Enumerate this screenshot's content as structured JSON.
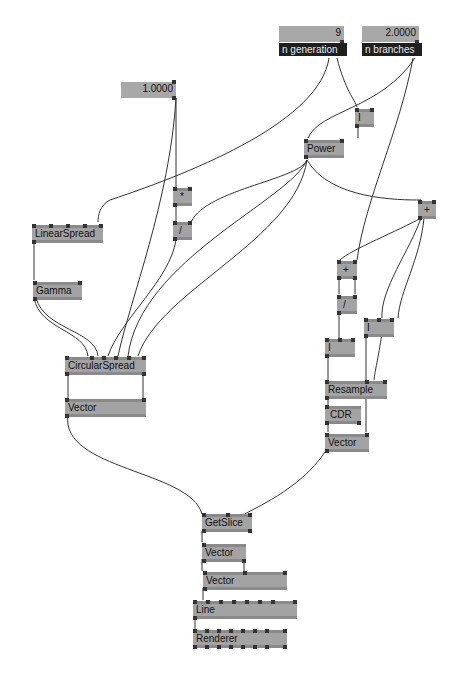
{
  "inputs": [
    {
      "id": "n_generation",
      "value": "9",
      "name": "n generation"
    },
    {
      "id": "n_branches",
      "value": "2.0000",
      "name": "n branches"
    },
    {
      "id": "scale",
      "value": "1.0000"
    }
  ],
  "nodes": {
    "i_top": "I",
    "power": "Power",
    "plus_right": "+",
    "multiply": "*",
    "divide_left": "/",
    "linear_spread": "LinearSpread",
    "gamma": "Gamma",
    "circular_spread": "CircularSpread",
    "vector_left": "Vector",
    "plus_mid": "+",
    "divide_right": "/",
    "i_left": "I",
    "i_right": "I",
    "resample": "Resample",
    "cdr": "CDR",
    "vector_right": "Vector",
    "getslice": "GetSlice",
    "vector_a": "Vector",
    "vector_b": "Vector",
    "line": "Line",
    "renderer": "Renderer"
  },
  "colors": {
    "node_fill": "#a3a3a3",
    "node_border": "#8a8a8a",
    "pin": "#333333",
    "wire": "#333333",
    "name_bar": "#1f1f1f",
    "background": "#ffffff"
  }
}
